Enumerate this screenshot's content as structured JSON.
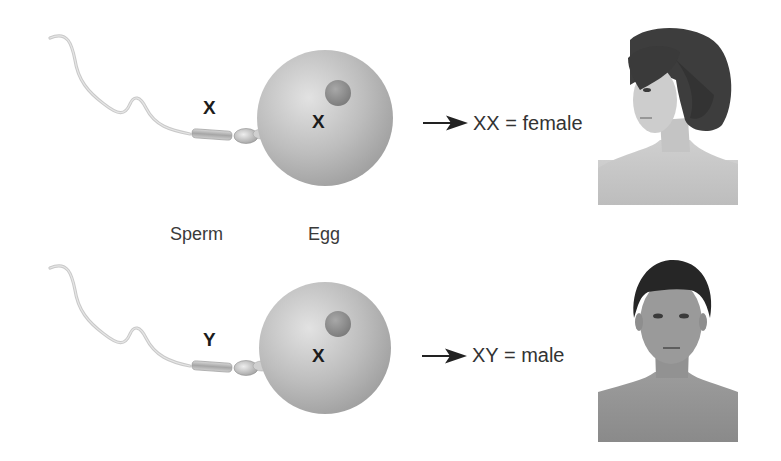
{
  "diagram": {
    "rows": [
      {
        "id": "female-row",
        "sperm_chromosome": "X",
        "egg_chromosome": "X",
        "result_genotype": "XX",
        "result_equals": "=",
        "result_sex": "female",
        "portrait": "female-portrait"
      },
      {
        "id": "male-row",
        "sperm_chromosome": "Y",
        "egg_chromosome": "X",
        "result_genotype": "XY",
        "result_equals": "=",
        "result_sex": "male",
        "portrait": "male-portrait"
      }
    ],
    "labels": {
      "sperm": "Sperm",
      "egg": "Egg"
    },
    "icons": {
      "arrow": "arrow-right-icon"
    },
    "colors": {
      "background": "#ffffff",
      "egg_fill": "#b9b9b9",
      "nucleus_fill": "#8e8e8e",
      "text": "#2a2a2a",
      "arrow": "#222222"
    }
  }
}
